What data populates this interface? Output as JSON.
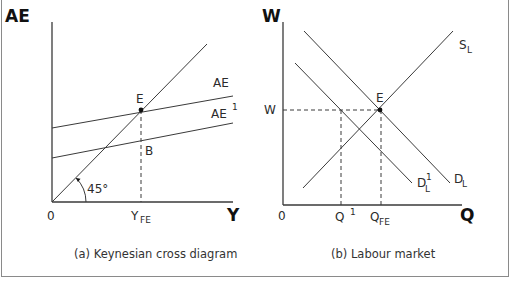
{
  "figure": {
    "border_color": "#8a8a8a",
    "line_color": "#3a3a3a"
  },
  "panel_a": {
    "caption": "(a) Keynesian cross diagram",
    "y_axis_label": "AE",
    "x_axis_label": "Y",
    "origin_label": "0",
    "angle_label": "45°",
    "point_e_label": "E",
    "point_b_label": "B",
    "yfe_label": "Y",
    "yfe_sub": "FE",
    "ae_label": "AE",
    "ae1_label": "AE",
    "ae1_sup": "1",
    "geometry": {
      "origin": [
        52,
        202
      ],
      "y_axis_top": [
        52,
        22
      ],
      "x_axis_end": [
        233,
        202
      ],
      "line_45": [
        [
          52,
          202
        ],
        [
          207,
          44
        ]
      ],
      "ae_line": [
        [
          52,
          128
        ],
        [
          233,
          96
        ]
      ],
      "ae1_line": [
        [
          52,
          158
        ],
        [
          233,
          123
        ]
      ],
      "point_e": [
        141,
        110
      ],
      "yfe_x": 141
    }
  },
  "panel_b": {
    "caption": "(b) Labour market",
    "y_axis_label": "W",
    "x_axis_label": "Q",
    "origin_label": "0",
    "w_label": "W",
    "point_e_label": "E",
    "sl_label": "S",
    "sl_sub": "L",
    "dl_label": "D",
    "dl_sub": "L",
    "dl1_label": "D",
    "dl1_sub": "L",
    "dl1_sup": "1",
    "q1_label": "Q",
    "q1_sup": "1",
    "qfe_label": "Q",
    "qfe_sub": "FE",
    "geometry": {
      "origin": [
        283,
        205
      ],
      "y_axis_top": [
        283,
        22
      ],
      "x_axis_end": [
        462,
        205
      ],
      "supply": [
        [
          303,
          188
        ],
        [
          453,
          31
        ]
      ],
      "demand": [
        [
          304,
          31
        ],
        [
          450,
          183
        ]
      ],
      "demand1": [
        [
          295,
          63
        ],
        [
          412,
          183
        ]
      ],
      "point_e": [
        380,
        110
      ],
      "q1_x": 341,
      "qfe_x": 381
    }
  }
}
